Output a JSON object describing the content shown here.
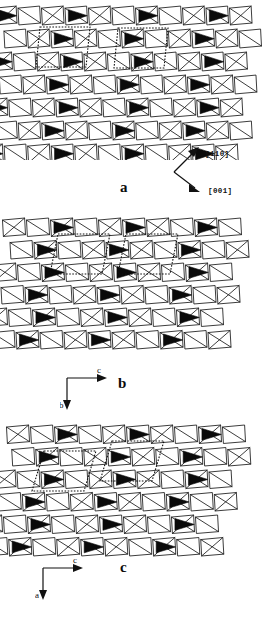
{
  "figure": {
    "kind": "crystal-structure-projection-figure",
    "background_color": "#ffffff",
    "line_color": "#1a1a1a",
    "fill_dark_color": "#0a0a0a",
    "fill_open_color": "#ffffff",
    "panel_count": 3
  },
  "panels": [
    {
      "id": "a",
      "letter": "a",
      "axis_style": "direction-vectors",
      "directions": [
        {
          "label": "[110]",
          "orientation": "up-right"
        },
        {
          "label": "[001]",
          "orientation": "down-right"
        }
      ],
      "lattice": {
        "rows": 7,
        "cols": 11,
        "shear": -0.1,
        "cell_w": 23.5,
        "cell_h": 23.0,
        "origin_x": -6,
        "origin_y": 4,
        "dark_phase": 0,
        "unit_cells": [
          {
            "x": 40,
            "y": 27,
            "w": 50,
            "h": 40
          },
          {
            "x": 118,
            "y": 28,
            "w": 50,
            "h": 40
          }
        ]
      }
    },
    {
      "id": "b",
      "letter": "b",
      "axis_style": "corner-axes",
      "axes": [
        {
          "label": "c",
          "orientation": "right"
        },
        {
          "label": "b",
          "orientation": "down"
        }
      ],
      "lattice": {
        "rows": 6,
        "cols": 10,
        "shear": -0.2,
        "cell_w": 24.0,
        "cell_h": 22.5,
        "origin_x": 2,
        "origin_y": 6,
        "dark_phase": 1,
        "unit_cells": [
          {
            "x": 58,
            "y": 24,
            "w": 52,
            "h": 40
          },
          {
            "x": 126,
            "y": 24,
            "w": 52,
            "h": 40
          }
        ]
      }
    },
    {
      "id": "c",
      "letter": "c",
      "axis_style": "corner-axes",
      "axes": [
        {
          "label": "c",
          "orientation": "right"
        },
        {
          "label": "a",
          "orientation": "down"
        }
      ],
      "lattice": {
        "rows": 6,
        "cols": 10,
        "shear": -0.3,
        "cell_w": 24.0,
        "cell_h": 22.5,
        "origin_x": 6,
        "origin_y": 8,
        "dark_phase": 1,
        "unit_cells": [
          {
            "x": 44,
            "y": 36,
            "w": 52,
            "h": 40
          },
          {
            "x": 112,
            "y": 26,
            "w": 52,
            "h": 40
          }
        ]
      }
    }
  ]
}
